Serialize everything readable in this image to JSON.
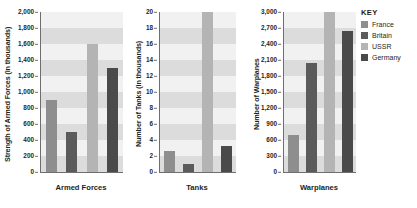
{
  "legend": {
    "title": "KEY",
    "entries": [
      {
        "label": "France",
        "color": "#8e8e8e"
      },
      {
        "label": "Britain",
        "color": "#5b5b5b"
      },
      {
        "label": "USSR",
        "color": "#b4b4b4"
      },
      {
        "label": "Germany",
        "color": "#4a4a4a"
      }
    ]
  },
  "chart_data": [
    {
      "type": "bar",
      "title": "",
      "xlabel": "Armed Forces",
      "ylabel": "Strength of Armed Forces (in thousands)",
      "categories": [
        "France",
        "Britain",
        "USSR",
        "Germany"
      ],
      "values": [
        900,
        500,
        1600,
        1300
      ],
      "ylim": [
        0,
        2000
      ],
      "ytick_step": 200,
      "ytick_labels": [
        "2,000",
        "1,800",
        "1,600",
        "1,400",
        "1,200",
        "1,000",
        "800",
        "600",
        "400",
        "200",
        "0"
      ],
      "grid": "horizontal-bands",
      "legend_position": "right-outside"
    },
    {
      "type": "bar",
      "title": "",
      "xlabel": "Tanks",
      "ylabel": "Number of Tanks (in thousands)",
      "categories": [
        "France",
        "Britain",
        "USSR",
        "Germany"
      ],
      "values": [
        2.6,
        1.0,
        20,
        3.2
      ],
      "ylim": [
        0,
        20
      ],
      "ytick_step": 2,
      "ytick_labels": [
        "20",
        "18",
        "16",
        "14",
        "12",
        "10",
        "8",
        "6",
        "4",
        "2",
        "0"
      ],
      "grid": "horizontal-bands",
      "legend_position": "right-outside"
    },
    {
      "type": "bar",
      "title": "",
      "xlabel": "Warplanes",
      "ylabel": "Number of Warplanes",
      "categories": [
        "France",
        "Britain",
        "USSR",
        "Germany"
      ],
      "values": [
        700,
        2050,
        3000,
        2650
      ],
      "ylim": [
        0,
        3000
      ],
      "ytick_step": 300,
      "ytick_labels": [
        "3,000",
        "2,700",
        "2,400",
        "2,100",
        "1,800",
        "1,500",
        "1,200",
        "900",
        "600",
        "300",
        "0"
      ],
      "grid": "horizontal-bands",
      "legend_position": "right-outside"
    }
  ]
}
